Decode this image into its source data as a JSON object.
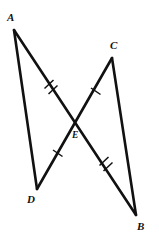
{
  "figure": {
    "kind": "geometry-diagram",
    "background_color": "#ffffff",
    "stroke_color": "#111111",
    "canvas": {
      "width": 159,
      "height": 247
    },
    "points": [
      {
        "id": "A",
        "label": "A",
        "x": 14,
        "y": 30,
        "label_x": 7,
        "label_y": 12
      },
      {
        "id": "C",
        "label": "C",
        "x": 112,
        "y": 58,
        "label_x": 110,
        "label_y": 40
      },
      {
        "id": "E",
        "label": "E",
        "x": 76,
        "y": 122,
        "label_x": 72,
        "label_y": 131
      },
      {
        "id": "D",
        "label": "D",
        "x": 37,
        "y": 189,
        "label_x": 27,
        "label_y": 194
      },
      {
        "id": "B",
        "label": "B",
        "x": 136,
        "y": 215,
        "label_x": 137,
        "label_y": 221
      }
    ],
    "segments": [
      {
        "id": "AB",
        "from": "A",
        "to": "B",
        "name": "segment-ab"
      },
      {
        "id": "CD",
        "from": "C",
        "to": "D",
        "name": "segment-cd"
      },
      {
        "id": "AD",
        "from": "A",
        "to": "D",
        "name": "segment-ad"
      },
      {
        "id": "CB",
        "from": "C",
        "to": "B",
        "name": "segment-cb"
      }
    ],
    "tick_marks": [
      {
        "id": "AE",
        "on_segment": "AB",
        "count": 2,
        "x": 50,
        "y": 86,
        "name": "tick-mark-ae-double"
      },
      {
        "id": "EB",
        "on_segment": "AB",
        "count": 2,
        "x": 105,
        "y": 163,
        "name": "tick-mark-eb-double"
      },
      {
        "id": "CE",
        "on_segment": "CD",
        "count": 1,
        "x": 96,
        "y": 91,
        "name": "tick-mark-ce-single"
      },
      {
        "id": "DE",
        "on_segment": "CD",
        "count": 1,
        "x": 58,
        "y": 153,
        "name": "tick-mark-de-single"
      }
    ]
  }
}
